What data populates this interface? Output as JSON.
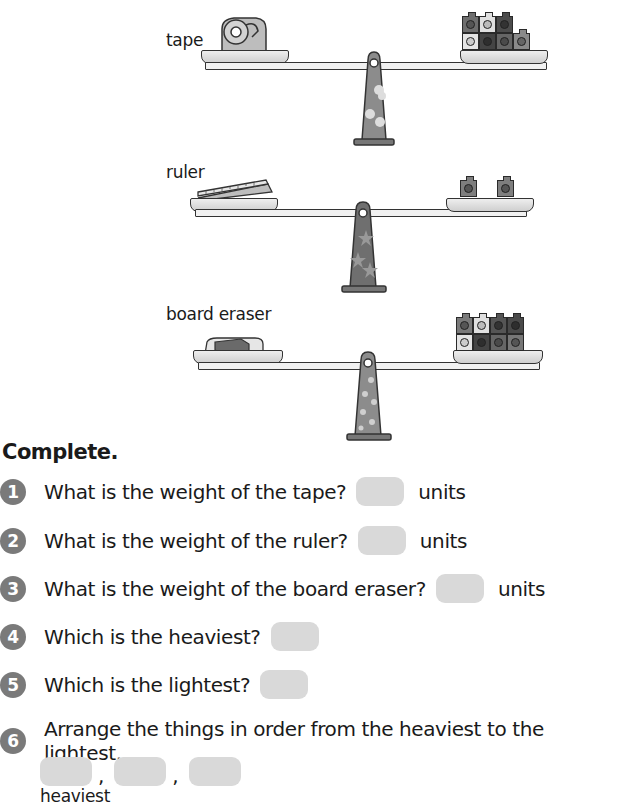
{
  "balances": [
    {
      "label": "tape",
      "object": "tape-dispenser",
      "right_cubes": 7,
      "stand_pattern": "blobs"
    },
    {
      "label": "ruler",
      "object": "ruler",
      "right_cubes": 2,
      "stand_pattern": "stars"
    },
    {
      "label": "board eraser",
      "object": "board-eraser",
      "right_cubes": 8,
      "stand_pattern": "flowers"
    }
  ],
  "heading": "Complete.",
  "questions": [
    {
      "number": "1",
      "text": "What is the weight of the tape?",
      "answer": "",
      "suffix": "units"
    },
    {
      "number": "2",
      "text": "What is the weight of the ruler?",
      "answer": "",
      "suffix": "units"
    },
    {
      "number": "3",
      "text": "What is the weight of the board eraser?",
      "answer": "",
      "suffix": "units"
    },
    {
      "number": "4",
      "text": "Which is the heaviest?",
      "answer": ""
    },
    {
      "number": "5",
      "text": "Which is the lightest?",
      "answer": ""
    },
    {
      "number": "6",
      "text": "Arrange the things in order from the heaviest to the lightest.",
      "answers": [
        "",
        "",
        ""
      ],
      "separator": ",",
      "under_label": "heaviest"
    }
  ],
  "colors": {
    "number_badge": "#7a7a7a",
    "answer_box": "#d9d9d9",
    "stand_fill": "#8c8c8c",
    "cube_dark": "#5a5a5a",
    "cube_mid": "#7e7e7e",
    "cube_light": "#d8d8d8"
  }
}
